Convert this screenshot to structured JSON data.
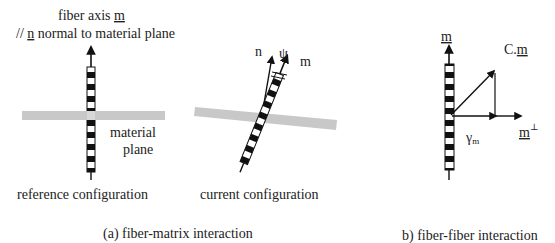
{
  "panel_a": {
    "caption": "(a) fiber-matrix interaction",
    "reference": {
      "title_line1": "fiber axis m",
      "title_line1_prefix": "fiber axis ",
      "title_line1_vec": "m",
      "title_line2_prefix": "// ",
      "title_line2_vec": "n",
      "title_line2_suffix": " normal to  material plane",
      "plane_label_line1": "material",
      "plane_label_line2": "plane",
      "config_label": "reference configuration"
    },
    "current": {
      "normal_label": "n",
      "angle_label": "ψ",
      "fiber_label": "m",
      "config_label": "current configuration"
    }
  },
  "panel_b": {
    "caption": "b) fiber-fiber interaction",
    "fiber_vec_label": "m",
    "stretched_label": "C.m",
    "stretched_prefix": "C.",
    "stretched_vec": "m",
    "shear_label": "γ",
    "shear_sub": "m",
    "perp_vec": "m",
    "perp_sup": "⊥"
  },
  "colors": {
    "ink": "#111111",
    "plane": "#c8c8c8",
    "background": "#ffffff"
  }
}
